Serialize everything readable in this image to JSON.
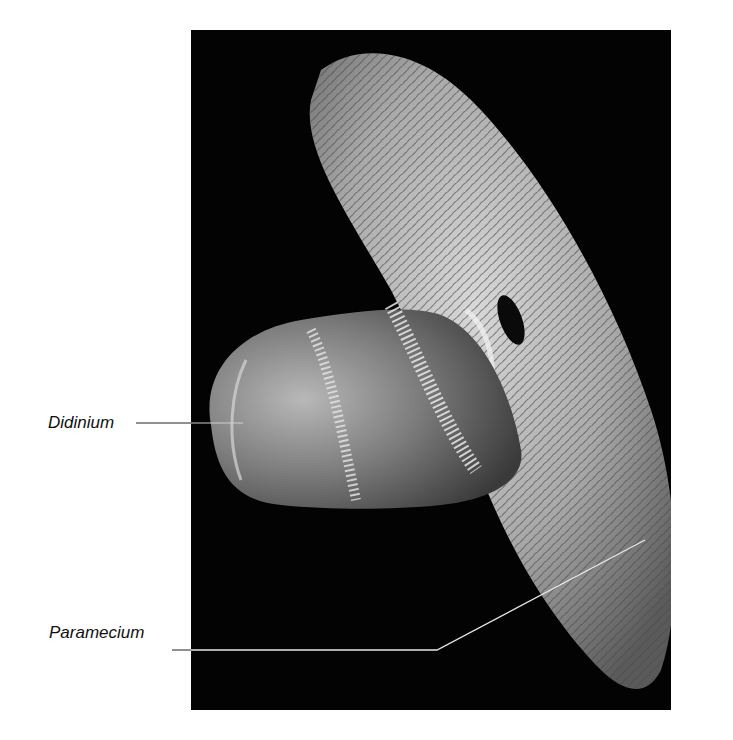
{
  "figure": {
    "background_color": "#ffffff",
    "photo_background_color": "#030303",
    "labels": [
      {
        "text": "Didinium",
        "target": "didinium"
      },
      {
        "text": "Paramecium",
        "target": "paramecium"
      }
    ],
    "leader_line_colors": {
      "on_white": "#222222",
      "on_photo": "#e6e6e6"
    }
  }
}
